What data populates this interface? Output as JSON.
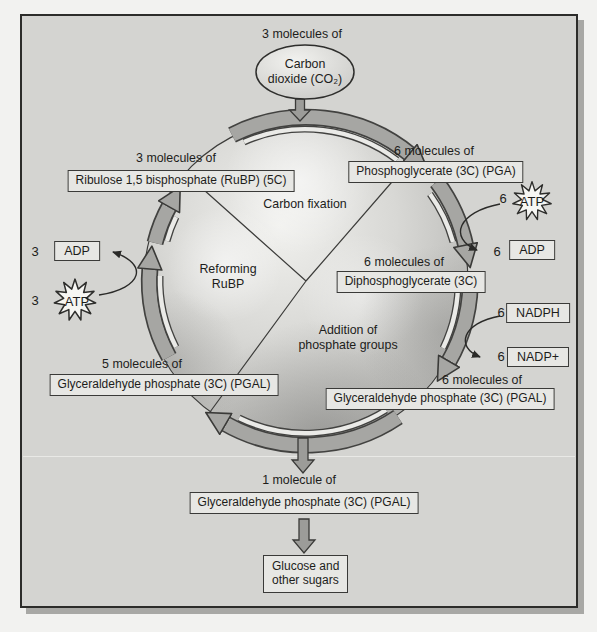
{
  "colors": {
    "page_background": "#f2f2f0",
    "panel_background": "#d4d4d1",
    "box_fill": "#e7e7e4",
    "outline": "#3a3a38",
    "arrow_fill": "#a6a6a3"
  },
  "input": {
    "count_label": "3 molecules of",
    "ellipse_line1": "Carbon",
    "ellipse_line2": "dioxide (CO₂)"
  },
  "sectors": {
    "top": "Carbon fixation",
    "left_line1": "Reforming",
    "left_line2": "RuBP",
    "right_line1": "Addition of",
    "right_line2": "phosphate groups"
  },
  "boxes": {
    "rubp": {
      "count": "3 molecules of",
      "text": "Ribulose 1,5 bisphosphate (RuBP) (5C)"
    },
    "pga": {
      "count": "6 molecules of",
      "text": "Phosphoglycerate (3C) (PGA)"
    },
    "dpg": {
      "count": "6 molecules of",
      "text": "Diphosphoglycerate (3C)"
    },
    "pgal_right": {
      "count": "6 molecules of",
      "text": "Glyceraldehyde phosphate (3C) (PGAL)"
    },
    "pgal_left": {
      "count": "5 molecules of",
      "text": "Glyceraldehyde phosphate (3C) (PGAL)"
    },
    "pgal_output": {
      "count": "1 molecule of",
      "text": "Glyceraldehyde phosphate (3C) (PGAL)"
    },
    "glucose_line1": "Glucose and",
    "glucose_line2": "other sugars"
  },
  "cofactors": {
    "atp_right": {
      "count": "6",
      "label": "ATP"
    },
    "adp_right": {
      "count": "6",
      "label": "ADP"
    },
    "nadph": {
      "count": "6",
      "label": "NADPH"
    },
    "nadp_plus": {
      "count": "6",
      "label": "NADP+"
    },
    "atp_left": {
      "count": "3",
      "label": "ATP"
    },
    "adp_left": {
      "count": "3",
      "label": "ADP"
    }
  }
}
